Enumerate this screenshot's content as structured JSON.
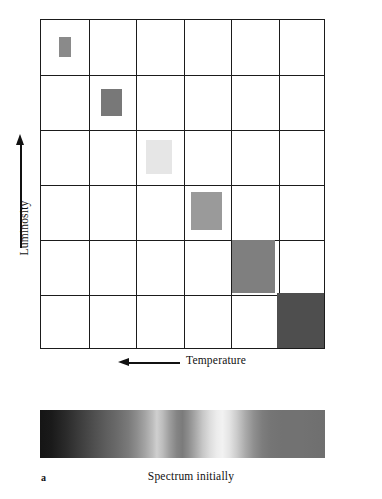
{
  "figure": {
    "panel_letter": "a",
    "caption": "Spectrum initially",
    "axes": {
      "y_label": "Luminosity",
      "y_arrow_direction": "up",
      "x_label": "Temperature",
      "x_arrow_direction": "left"
    }
  },
  "chart_data": {
    "type": "scatter",
    "title": "",
    "subtitle": "",
    "xlabel": "Temperature",
    "ylabel": "Luminosity",
    "x_axis_direction": "decreasing-to-the-right",
    "y_axis_direction": "increasing-upward",
    "grid": true,
    "grid_columns": 6,
    "grid_rows": 6,
    "legend": "none",
    "annotations": [
      "a",
      "Spectrum initially"
    ],
    "series": [
      {
        "name": "stellar-blocks",
        "points": [
          {
            "id": "block-1",
            "col": 1,
            "row": 1,
            "color": "#8a8a8a",
            "width_px": 12,
            "height_px": 20,
            "note": "hottest / faintest-size block, top-left cell"
          },
          {
            "id": "block-2",
            "col": 2,
            "row": 2,
            "color": "#787878",
            "width_px": 21,
            "height_px": 27,
            "note": "second cell down-right"
          },
          {
            "id": "block-3",
            "col": 3,
            "row": 3,
            "color": "#e6e6e6",
            "width_px": 26,
            "height_px": 34,
            "note": "lightest block, middle cell"
          },
          {
            "id": "block-4",
            "col": 4,
            "row": 4,
            "color": "#9a9a9a",
            "width_px": 31,
            "height_px": 38,
            "note": "mid-gray block"
          },
          {
            "id": "block-5",
            "col": 5,
            "row": 5,
            "color": "#7f7f7f",
            "width_px": 43,
            "height_px": 53,
            "note": "large gray block"
          },
          {
            "id": "block-6",
            "col": 6,
            "row": 6,
            "color": "#4e4e4e",
            "width_px": 47,
            "height_px": 55,
            "note": "darkest block, fills the entire bottom-right cell"
          }
        ]
      }
    ],
    "spectrum": {
      "description": "Horizontal grayscale spectrum strip with absorption bands",
      "left_end": "dark",
      "right_end": "medium gray",
      "bright_peaks_fraction": [
        0.41,
        0.63
      ],
      "dark_bands_fraction": [
        0.03,
        0.5,
        0.85
      ]
    }
  }
}
